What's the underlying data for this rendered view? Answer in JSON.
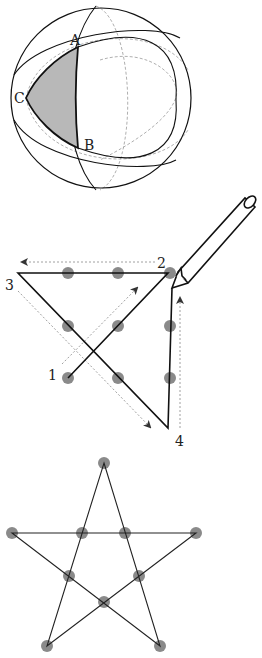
{
  "figure1": {
    "title": "Spherical triangle on a sphere",
    "labels": {
      "A": "A",
      "B": "B",
      "C": "C"
    },
    "colors": {
      "shade": "#b8b8b8",
      "line": "#111111",
      "dashed": "#999999"
    }
  },
  "figure2": {
    "title": "Nine dots connected with four lines",
    "labels": {
      "p1": "1",
      "p2": "2",
      "p3": "3",
      "p4": "4"
    },
    "colors": {
      "dot": "#8a8a8a",
      "line": "#111111",
      "arrow": "#777777"
    }
  },
  "figure3": {
    "title": "Ten dots on a five-pointed star",
    "colors": {
      "dot": "#8a8a8a",
      "line": "#222222"
    }
  }
}
